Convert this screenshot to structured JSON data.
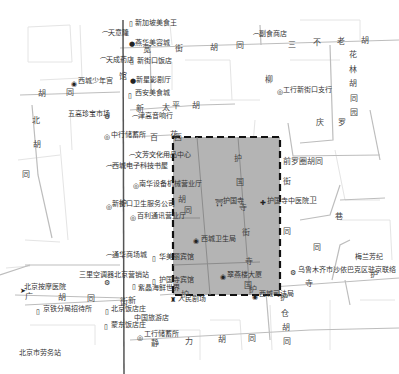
{
  "map": {
    "highlight_region": {
      "style": "dashed-border",
      "fill": "#b4b4b4",
      "border": "#111111"
    },
    "colors": {
      "background": "#ffffff",
      "minor_road": "#d0d0d0",
      "major_road": "#555555"
    },
    "pois": [
      {
        "id": "xinjiapo",
        "label": "新加坡美食王",
        "icon": "shop-icon"
      },
      {
        "id": "tianhui",
        "label": "天意隆",
        "icon": "phone-icon"
      },
      {
        "id": "huahua",
        "label": "燕华美容城",
        "icon": "dot-icon"
      },
      {
        "id": "tiancheng",
        "label": "天成药店",
        "icon": "phone-icon"
      },
      {
        "id": "xinjiekou-restaurant",
        "label": "新街口饭店",
        "icon": "shop-icon"
      },
      {
        "id": "youth-palace",
        "label": "西城少年宫",
        "icon": "circle-dot-icon"
      },
      {
        "id": "cinema",
        "label": "新星影剧厅",
        "icon": "dot-icon"
      },
      {
        "id": "food-city",
        "label": "西安美食城",
        "icon": "shop-icon"
      },
      {
        "id": "wuhua-market",
        "label": "五高珍宝市场",
        "icon": "gear-icon"
      },
      {
        "id": "music-hall",
        "label": "津高音响行",
        "icon": "phone-icon"
      },
      {
        "id": "store-mgmt",
        "label": "中行储蓄所",
        "icon": "bank-icon"
      },
      {
        "id": "wenfu",
        "label": "文芳文化用品中心",
        "icon": "phone-icon"
      },
      {
        "id": "bookstore",
        "label": "西城电子科技书屋",
        "icon": "phone-icon"
      },
      {
        "id": "equipment",
        "label": "南华设备机械营业厅",
        "icon": "bank-icon"
      },
      {
        "id": "xinjiekou-office",
        "label": "新街口卫生服务公司",
        "icon": "bank-icon"
      },
      {
        "id": "baili",
        "label": "百利通讯营业厅",
        "icon": "bank-icon"
      },
      {
        "id": "huguo-temple",
        "label": "护国寺",
        "icon": "temple-icon"
      },
      {
        "id": "tcm-hospital",
        "label": "护国寺中医院",
        "icon": "hospital-icon"
      },
      {
        "id": "health-bureau",
        "label": "西城卫生局",
        "icon": "circle-dot-icon"
      },
      {
        "id": "icbc-branch",
        "label": "工行新街口支行",
        "icon": "bank-icon"
      },
      {
        "id": "hotel-shop",
        "label": "副食商店",
        "icon": "phone-icon"
      },
      {
        "id": "shopping-city",
        "label": "通华商场城",
        "icon": "phone-icon"
      },
      {
        "id": "zhongmei",
        "label": "华美丽宾馆",
        "icon": "shop-icon"
      },
      {
        "id": "bus-station",
        "label": "三里空调器北京营销站",
        "icon": "gear-icon"
      },
      {
        "id": "rehab",
        "label": "北京按摩医院",
        "icon": "hospital-icon"
      },
      {
        "id": "huguo-hotel",
        "label": "护国寺宾馆",
        "icon": "shop-icon"
      },
      {
        "id": "yanshan",
        "label": "紫晶海鲜世界",
        "icon": "shop-icon"
      },
      {
        "id": "theater",
        "label": "人民剧场",
        "icon": "theater-icon"
      },
      {
        "id": "railway",
        "label": "京铁分局招待所",
        "icon": "shop-icon"
      },
      {
        "id": "beijing-restaurant",
        "label": "北京饭店庄",
        "icon": "shop-icon"
      },
      {
        "id": "zhongguo-inn",
        "label": "中国旅游店",
        "icon": "phone-icon"
      },
      {
        "id": "fengdong",
        "label": "蒙东饭店庄",
        "icon": "shop-icon"
      },
      {
        "id": "icbc-savings",
        "label": "工行储蓄所",
        "icon": "bank-icon"
      },
      {
        "id": "mansion",
        "label": "翠燕楼大厦",
        "icon": "circle-dot-icon"
      },
      {
        "id": "court",
        "label": "西城司法局",
        "icon": "circle-dot-icon"
      },
      {
        "id": "meilan",
        "label": "梅兰芳纪",
        "icon": "none"
      },
      {
        "id": "urumqi",
        "label": "乌鲁木齐市沙依巴克区驻京联络",
        "icon": "gear-icon"
      },
      {
        "id": "bottom-left",
        "label": "北京市劳务站",
        "icon": "none"
      }
    ],
    "road_labels": [
      {
        "id": "r-kuan1",
        "text": "宽"
      },
      {
        "id": "r-jie1",
        "text": "街"
      },
      {
        "id": "r-hu1",
        "text": "胡"
      },
      {
        "id": "r-tong1",
        "text": "同"
      },
      {
        "id": "r-san",
        "text": "三"
      },
      {
        "id": "r-bu",
        "text": "不"
      },
      {
        "id": "r-lao",
        "text": "老"
      },
      {
        "id": "r-hu2",
        "text": "胡"
      },
      {
        "id": "r-hua",
        "text": "花"
      },
      {
        "id": "r-lin",
        "text": "林"
      },
      {
        "id": "r-hu3",
        "text": "胡"
      },
      {
        "id": "r-tong3",
        "text": "同"
      },
      {
        "id": "r-yuan",
        "text": "园"
      },
      {
        "id": "r-qing",
        "text": "庆"
      },
      {
        "id": "r-luo",
        "text": "罗"
      },
      {
        "id": "r-qianluo",
        "text": "前罗圈胡同"
      },
      {
        "id": "r-wei",
        "text": "卫"
      },
      {
        "id": "r-xiang",
        "text": "巷"
      },
      {
        "id": "r-liu",
        "text": "柳"
      },
      {
        "id": "r-xin",
        "text": "新"
      },
      {
        "id": "r-tai",
        "text": "太"
      },
      {
        "id": "r-ping",
        "text": "平"
      },
      {
        "id": "r-hu4",
        "text": "胡"
      },
      {
        "id": "r-bei",
        "text": "北"
      },
      {
        "id": "r-hu5",
        "text": "胡"
      },
      {
        "id": "r-tong5",
        "text": "同"
      },
      {
        "id": "r-hu6",
        "text": "胡"
      },
      {
        "id": "r-tong6",
        "text": "同"
      },
      {
        "id": "r-bai",
        "text": "百"
      },
      {
        "id": "r-hua2",
        "text": "花"
      },
      {
        "id": "r-hu-v",
        "text": "护"
      },
      {
        "id": "r-guo-v",
        "text": "国"
      },
      {
        "id": "r-si-v",
        "text": "寺"
      },
      {
        "id": "r-jie-v",
        "text": "街"
      },
      {
        "id": "r-hu-tong",
        "text": "胡"
      },
      {
        "id": "r-tong-i",
        "text": "同"
      },
      {
        "id": "r-xi",
        "text": "西"
      },
      {
        "id": "r-jie-r",
        "text": "街"
      },
      {
        "id": "r-tong-r",
        "text": "同"
      },
      {
        "id": "r-guan",
        "text": "馆"
      },
      {
        "id": "r-guo-b",
        "text": "国"
      },
      {
        "id": "r-si-b",
        "text": "寺"
      },
      {
        "id": "r-si-b2",
        "text": "寺"
      },
      {
        "id": "r-tong-b",
        "text": "同"
      },
      {
        "id": "r-hu-b",
        "text": "护"
      },
      {
        "id": "r-guang",
        "text": "广"
      },
      {
        "id": "r-hu7",
        "text": "胡"
      },
      {
        "id": "r-tong7",
        "text": "同"
      },
      {
        "id": "r-jie-bc",
        "text": "街"
      },
      {
        "id": "r-hu-bc",
        "text": "护"
      },
      {
        "id": "r-hu-cang",
        "text": "护"
      },
      {
        "id": "r-cang",
        "text": "仓"
      },
      {
        "id": "r-hu8",
        "text": "胡"
      },
      {
        "id": "r-tong8",
        "text": "同"
      },
      {
        "id": "r-jing",
        "text": "静"
      },
      {
        "id": "r-li",
        "text": "力"
      },
      {
        "id": "r-hu9",
        "text": "胡"
      },
      {
        "id": "r-tong9",
        "text": "同"
      },
      {
        "id": "r-huguo-hu",
        "text": "护"
      },
      {
        "id": "r-xin2",
        "text": "新"
      },
      {
        "id": "r-hu-ve",
        "text": "护"
      }
    ]
  }
}
